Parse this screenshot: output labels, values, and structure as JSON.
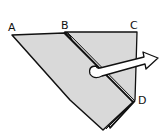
{
  "diagram": {
    "type": "origami-fold-step",
    "labels": {
      "a": "A",
      "b": "B",
      "c": "C",
      "d": "D"
    },
    "colors": {
      "paper": "#d9d9d9",
      "outline": "#111111",
      "arrow_fill": "#ffffff"
    },
    "arrow": "fold-over-arrow"
  }
}
